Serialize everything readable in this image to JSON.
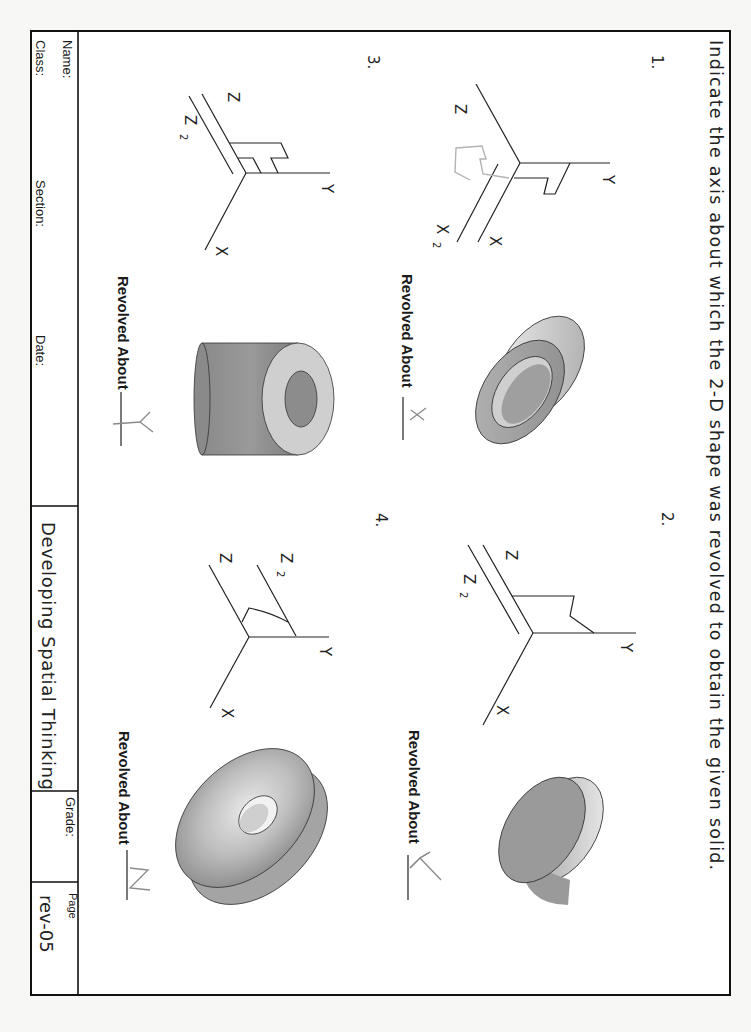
{
  "instructions": "Indicate the axis about which the 2-D shape was revolved to obtain the given solid.",
  "title_block": {
    "name_label": "Name:",
    "class_label": "Class:",
    "section_label": "Section:",
    "date_label": "Date:",
    "title": "Developing Spatial Thinking",
    "grade_label": "Grade:",
    "page_label": "Page",
    "page_value": "rev-05"
  },
  "problems": [
    {
      "number": "1.",
      "axes": {
        "z": "Z",
        "y": "Y",
        "x": "X",
        "extra": "X",
        "extra_sub": "2"
      },
      "answer_prompt": "Revolved About",
      "handwritten_answer": "X",
      "solid": "ring / short tube revolved about X"
    },
    {
      "number": "2.",
      "axes": {
        "z": "Z",
        "y": "Y",
        "x": "X",
        "extra": "Z",
        "extra_sub": "2"
      },
      "answer_prompt": "Revolved About",
      "handwritten_answer": "Y",
      "solid": "flanged disc revolved about Y"
    },
    {
      "number": "3.",
      "axes": {
        "z": "Z",
        "y": "Y",
        "x": "X",
        "extra": "Z",
        "extra_sub": "2"
      },
      "answer_prompt": "Revolved About",
      "handwritten_answer": "Y",
      "solid": "thick cylindrical tube revolved about Y"
    },
    {
      "number": "4.",
      "axes": {
        "z": "Z",
        "y": "Y",
        "x": "X",
        "extra": "Z",
        "extra_sub": "2"
      },
      "answer_prompt": "Revolved About",
      "handwritten_answer": "Z",
      "solid": "countersunk washer revolved about Z"
    }
  ],
  "colors": {
    "ink": "#222222",
    "pencil": "#8a8a8a",
    "paper": "#ffffff",
    "solid_dark": "#8f8f8f",
    "solid_light": "#e6e6e6"
  }
}
